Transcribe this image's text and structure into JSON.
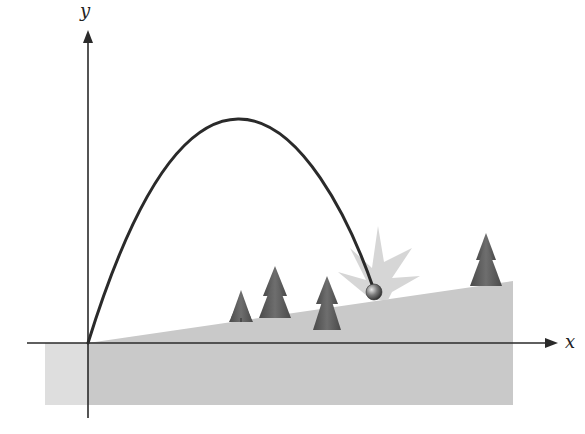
{
  "figure": {
    "axes": {
      "x_label": "x",
      "y_label": "y",
      "origin_px": [
        88,
        343
      ]
    },
    "colors": {
      "axis": "#2a2a2a",
      "trajectory": "#2a2a2a",
      "ground_main": "#c9c9c9",
      "ground_left": "#dedede",
      "starburst": "#d6d6d6",
      "tree": "#5a5a5a",
      "ball": "#6a6a6a"
    },
    "elements": {
      "trajectory": "parabolic path from origin to impact point on slope",
      "ball": "projectile at impact",
      "impact_burst": "starburst indicating impact",
      "trees": [
        "tree-1",
        "tree-2",
        "tree-3",
        "tree-4"
      ]
    }
  }
}
